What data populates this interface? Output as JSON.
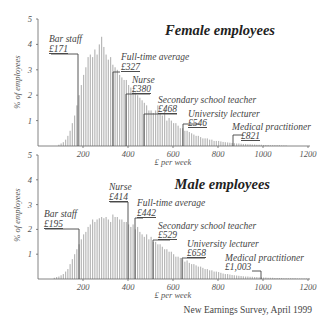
{
  "source": "New Earnings Survey, April 1999",
  "chart_data": [
    {
      "type": "bar",
      "title": "Female employees",
      "xlabel": "£ per week",
      "ylabel": "% of employees",
      "xlim": [
        0,
        1200
      ],
      "ylim": [
        0,
        5
      ],
      "xticks": [
        200,
        400,
        600,
        800,
        1000,
        1200
      ],
      "yticks": [
        1,
        2,
        3,
        4,
        5
      ],
      "bin_width": 10,
      "bin_start": 90,
      "values": [
        0.05,
        0.1,
        0.15,
        0.25,
        0.4,
        0.6,
        0.9,
        1.2,
        1.6,
        2.0,
        2.4,
        2.8,
        3.1,
        3.5,
        3.6,
        3.5,
        3.8,
        3.6,
        4.0,
        4.3,
        3.9,
        3.6,
        3.4,
        3.5,
        3.2,
        3.1,
        3.0,
        2.8,
        2.7,
        2.6,
        2.6,
        2.4,
        2.3,
        2.2,
        2.1,
        2.0,
        1.9,
        1.8,
        1.7,
        1.6,
        1.4,
        1.4,
        1.3,
        1.4,
        1.6,
        1.3,
        1.2,
        1.5,
        1.0,
        1.1,
        1.0,
        0.9,
        0.9,
        0.8,
        0.7,
        0.7,
        0.6,
        0.6,
        0.55,
        0.5,
        0.45,
        0.4,
        0.4,
        0.35,
        0.3,
        0.3,
        0.3,
        0.25,
        0.25,
        0.2,
        0.2,
        0.2,
        0.18,
        0.16,
        0.15,
        0.14,
        0.13,
        0.12,
        0.11,
        0.1,
        0.1,
        0.09,
        0.08,
        0.08,
        0.07,
        0.07,
        0.06,
        0.06,
        0.05,
        0.05,
        0.05,
        0.04,
        0.04,
        0.04,
        0.03,
        0.03,
        0.03,
        0.03,
        0.03,
        0.02,
        0.02,
        0.02
      ],
      "annotations": [
        {
          "label": "Bar staff",
          "value": "£171",
          "x": 171,
          "y": 3.6
        },
        {
          "label": "Full-time average",
          "value": "£327",
          "x": 327,
          "y": 2.9
        },
        {
          "label": "Nurse",
          "value": "£380",
          "x": 380,
          "y": 2.0
        },
        {
          "label": "Secondary school teacher",
          "value": "£468",
          "x": 468,
          "y": 1.2
        },
        {
          "label": "University lecturer",
          "value": "£546",
          "x": 546,
          "y": 0.9
        },
        {
          "label": "Medical practitioner",
          "value": "£821",
          "x": 821,
          "y": 0.4
        }
      ]
    },
    {
      "type": "bar",
      "title": "Male employees",
      "xlabel": "£ per week",
      "ylabel": "% of employees",
      "xlim": [
        0,
        1200
      ],
      "ylim": [
        0,
        5
      ],
      "xticks": [
        200,
        400,
        600,
        800,
        1000,
        1200
      ],
      "yticks": [
        1,
        2,
        3,
        4,
        5
      ],
      "bin_width": 10,
      "bin_start": 70,
      "values": [
        0.05,
        0.08,
        0.1,
        0.15,
        0.2,
        0.3,
        0.4,
        0.6,
        0.8,
        1.0,
        1.2,
        1.4,
        1.6,
        1.8,
        1.9,
        2.1,
        2.2,
        2.4,
        2.3,
        2.4,
        2.45,
        2.5,
        2.45,
        2.5,
        2.4,
        2.3,
        2.6,
        2.5,
        2.5,
        2.4,
        2.4,
        2.3,
        2.3,
        2.2,
        2.1,
        2.2,
        2.0,
        2.1,
        1.9,
        1.8,
        1.7,
        1.8,
        1.6,
        1.7,
        1.5,
        1.5,
        1.4,
        1.4,
        1.3,
        1.2,
        1.2,
        1.1,
        1.1,
        1.0,
        0.9,
        0.9,
        0.85,
        0.8,
        0.7,
        0.75,
        0.65,
        0.6,
        0.6,
        0.55,
        0.5,
        0.5,
        0.45,
        0.4,
        0.4,
        0.35,
        0.35,
        0.3,
        0.3,
        0.28,
        0.25,
        0.22,
        0.2,
        0.2,
        0.18,
        0.16,
        0.15,
        0.14,
        0.13,
        0.12,
        0.11,
        0.1,
        0.1,
        0.09,
        0.09,
        0.08,
        0.08,
        0.07,
        0.07,
        0.06,
        0.06,
        0.05,
        0.05,
        0.05,
        0.04,
        0.04,
        0.04,
        0.04,
        0.03,
        0.03,
        0.03,
        0.03,
        0.03,
        0.03,
        0.02,
        0.02,
        0.02,
        0.02,
        0.02,
        0.02
      ],
      "annotations": [
        {
          "label": "Bar staff",
          "value": "£195",
          "x": 195,
          "y": 1.95
        },
        {
          "label": "Nurse",
          "value": "£414",
          "x": 414,
          "y": 3.0
        },
        {
          "label": "Full-time average",
          "value": "£442",
          "x": 442,
          "y": 2.35
        },
        {
          "label": "Secondary school teacher",
          "value": "£529",
          "x": 529,
          "y": 1.5
        },
        {
          "label": "University lecturer",
          "value": "£658",
          "x": 658,
          "y": 0.75
        },
        {
          "label": "Medical practitioner",
          "value": "£1,003",
          "x": 1003,
          "y": 0.25
        }
      ]
    }
  ],
  "panels": {
    "female": {
      "title": "Female employees",
      "ylabel": "% of employees",
      "xlabel": "£ per week",
      "yticks": [
        "5",
        "4",
        "3",
        "2",
        "1"
      ],
      "xticks": [
        "200",
        "400",
        "600",
        "800",
        "1000",
        "1200"
      ],
      "ann": [
        {
          "label": "Bar staff",
          "value": "£171"
        },
        {
          "label": "Full-time average",
          "value": "£327"
        },
        {
          "label": "Nurse",
          "value": "£380"
        },
        {
          "label": "Secondary school teacher",
          "value": "£468"
        },
        {
          "label": "University lecturer",
          "value": "£546"
        },
        {
          "label": "Medical practitioner",
          "value": "£821"
        }
      ]
    },
    "male": {
      "title": "Male employees",
      "ylabel": "% of employees",
      "xlabel": "£ per week",
      "yticks": [
        "5",
        "4",
        "3",
        "2",
        "1"
      ],
      "xticks": [
        "200",
        "400",
        "600",
        "800",
        "1000",
        "1200"
      ],
      "ann": [
        {
          "label": "Bar staff",
          "value": "£195"
        },
        {
          "label": "Nurse",
          "value": "£414"
        },
        {
          "label": "Full-time average",
          "value": "£442"
        },
        {
          "label": "Secondary school teacher",
          "value": "£529"
        },
        {
          "label": "University lecturer",
          "value": "£658"
        },
        {
          "label": "Medical practitioner",
          "value": "£1,003"
        }
      ]
    }
  }
}
